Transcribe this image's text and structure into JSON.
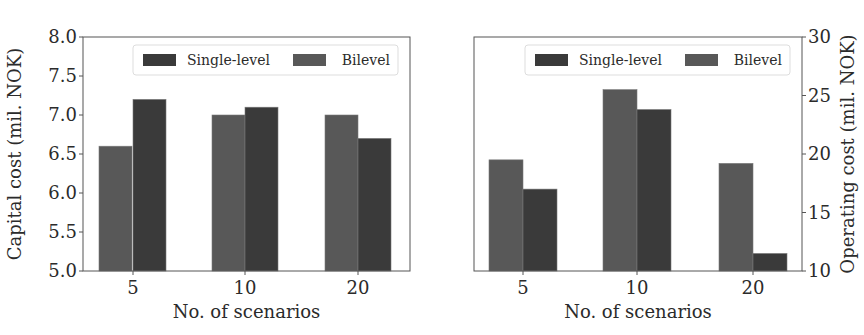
{
  "chart_data": [
    {
      "type": "bar",
      "title": "",
      "xlabel": "No. of scenarios",
      "ylabel": "Capital cost (mil. NOK)",
      "ylabel_side": "left",
      "categories": [
        "5",
        "10",
        "20"
      ],
      "series": [
        {
          "name": "Bilevel",
          "values": [
            6.6,
            7.0,
            7.0
          ],
          "color": "#585858"
        },
        {
          "name": "Single-level",
          "values": [
            7.2,
            7.1,
            6.7
          ],
          "color": "#3a3a3a"
        }
      ],
      "ylim": [
        5.0,
        8.0
      ],
      "yticks": [
        "5.0",
        "5.5",
        "6.0",
        "6.5",
        "7.0",
        "7.5",
        "8.0"
      ],
      "grid": false,
      "legend": {
        "position": "upper right",
        "entries": [
          "Single-level",
          "Bilevel"
        ]
      }
    },
    {
      "type": "bar",
      "title": "",
      "xlabel": "No. of scenarios",
      "ylabel": "Operating cost (mil. NOK)",
      "ylabel_side": "right",
      "categories": [
        "5",
        "10",
        "20"
      ],
      "series": [
        {
          "name": "Bilevel",
          "values": [
            19.5,
            25.5,
            19.2
          ],
          "color": "#585858"
        },
        {
          "name": "Single-level",
          "values": [
            17.0,
            23.8,
            11.5
          ],
          "color": "#3a3a3a"
        }
      ],
      "ylim": [
        10,
        30
      ],
      "yticks": [
        "10",
        "15",
        "20",
        "25",
        "30"
      ],
      "grid": false,
      "legend": {
        "position": "upper right",
        "entries": [
          "Single-level",
          "Bilevel"
        ]
      }
    }
  ],
  "layout": [
    {
      "box": {
        "x": 83,
        "y": 37,
        "w": 327,
        "h": 234
      },
      "bar_starts": [
        [
          99,
          133
        ],
        [
          212,
          245
        ],
        [
          325,
          358
        ]
      ],
      "bar_width": 33,
      "legend": {
        "x": 133,
        "y": 45,
        "w": 265,
        "h": 30
      }
    },
    {
      "box": {
        "x": 474,
        "y": 37,
        "w": 328,
        "h": 234
      },
      "bar_starts": [
        [
          489,
          523
        ],
        [
          603,
          637
        ],
        [
          719,
          753
        ]
      ],
      "bar_width": 34,
      "legend": {
        "x": 525,
        "y": 45,
        "w": 265,
        "h": 30
      }
    }
  ],
  "colors": {
    "single_level": "#3a3a3a",
    "bilevel": "#585858",
    "axis": "#555555",
    "legend_border": "#dddddd"
  }
}
